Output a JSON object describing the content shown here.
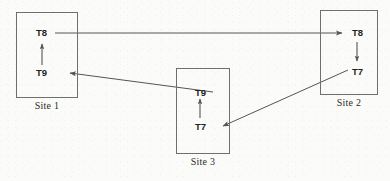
{
  "diagram": {
    "type": "wait-for-graph",
    "colors": {
      "background": "#fbfbfa",
      "box_border": "#6f6f6f",
      "arrow": "#555555",
      "label_text": "#2b2b2b",
      "txn_text": "#1f1f1f"
    },
    "sites": [
      {
        "id": "site-1",
        "label": "Site 1",
        "box": {
          "x": 16,
          "y": 12,
          "w": 62,
          "h": 86
        },
        "label_pos": {
          "x": 16,
          "y": 100,
          "w": 62
        },
        "transactions": [
          {
            "id": "site1-t8",
            "label": "T8",
            "x": 36,
            "y": 27
          },
          {
            "id": "site1-t9",
            "label": "T9",
            "x": 36,
            "y": 67
          }
        ],
        "internal_edge": {
          "from": "T9",
          "to": "T8",
          "direction": "up"
        }
      },
      {
        "id": "site-2",
        "label": "Site 2",
        "box": {
          "x": 320,
          "y": 10,
          "w": 58,
          "h": 85
        },
        "label_pos": {
          "x": 320,
          "y": 97,
          "w": 58
        },
        "transactions": [
          {
            "id": "site2-t8",
            "label": "T8",
            "x": 352,
            "y": 27
          },
          {
            "id": "site2-t7",
            "label": "T7",
            "x": 352,
            "y": 66
          }
        ],
        "internal_edge": {
          "from": "T8",
          "to": "T7",
          "direction": "down"
        }
      },
      {
        "id": "site-3",
        "label": "Site 3",
        "box": {
          "x": 176,
          "y": 68,
          "w": 54,
          "h": 86
        },
        "label_pos": {
          "x": 176,
          "y": 156,
          "w": 54
        },
        "transactions": [
          {
            "id": "site3-t9",
            "label": "T9",
            "x": 195,
            "y": 87
          },
          {
            "id": "site3-t7",
            "label": "T7",
            "x": 195,
            "y": 121
          }
        ],
        "internal_edge": {
          "from": "T7",
          "to": "T9",
          "direction": "up"
        }
      }
    ],
    "cross_site_edges": [
      {
        "id": "edge-site1-t8-to-site2-t8",
        "from": "Site 1 / T8",
        "to": "Site 2 / T8",
        "style": "horizontal",
        "points": "57,33 341,33"
      },
      {
        "id": "edge-site3-t9-to-site1-t9",
        "from": "Site 3 / T9",
        "to": "Site 1 / T9",
        "style": "diagonal",
        "points": "211,92 68,73"
      },
      {
        "id": "edge-site2-t7-to-site3-t7",
        "from": "Site 2 / T7",
        "to": "Site 3 / T7",
        "style": "diagonal",
        "points": "347,71 221,127"
      }
    ]
  }
}
